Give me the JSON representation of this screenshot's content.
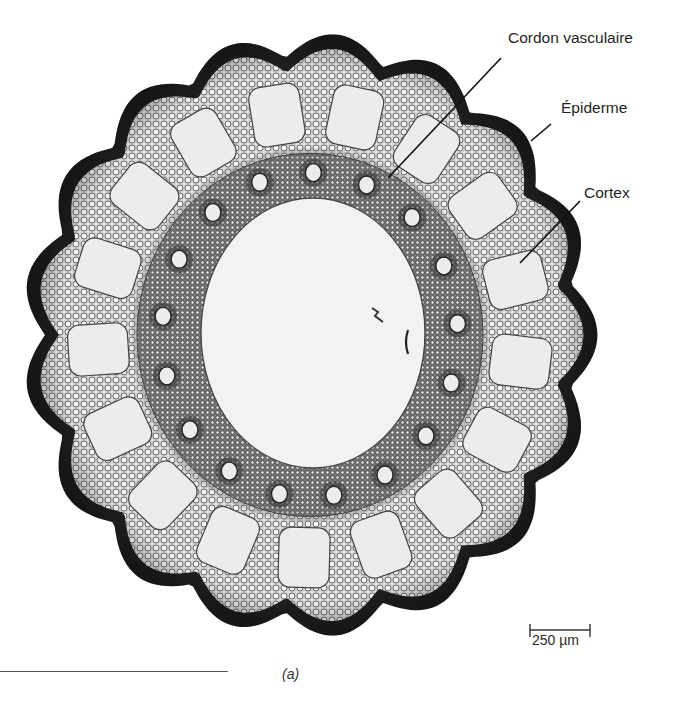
{
  "figure": {
    "panel_label": "(a)",
    "labels": [
      {
        "id": "vascular-bundle",
        "text": "Cordon vasculaire",
        "x": 508,
        "y": 38,
        "line": [
          [
            501,
            58
          ],
          [
            388,
            178
          ]
        ]
      },
      {
        "id": "epidermis",
        "text": "Épiderme",
        "x": 561,
        "y": 108,
        "line": [
          [
            551,
            124
          ],
          [
            531,
            141
          ]
        ]
      },
      {
        "id": "cortex",
        "text": "Cortex",
        "x": 584,
        "y": 193,
        "line": [
          [
            580,
            201
          ],
          [
            520,
            263
          ]
        ]
      }
    ],
    "scale_bar": {
      "text": "250 µm",
      "x1": 530,
      "x2": 590,
      "y": 630
    },
    "colors": {
      "epidermis": "#1e1e1e",
      "cortex_tissue": "#9a9a9a",
      "vascular_ring": "#5a5a5a",
      "canal_fill": "#ececec",
      "pith_fill": "#f2f2f2",
      "background": "#ffffff"
    },
    "geometry": {
      "center": [
        310,
        335
      ],
      "outer_radius": 285,
      "lobes": 17,
      "lobe_depth": 14,
      "canal_ring_radius": 212,
      "canal_count": 17,
      "bundle_ring_radius": 145,
      "bundle_count": 17,
      "pith_rx": 112,
      "pith_ry": 135
    }
  }
}
